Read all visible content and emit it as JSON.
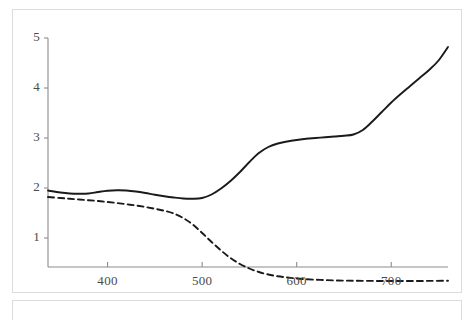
{
  "chart_data": {
    "type": "line",
    "title": "",
    "subtitle": "",
    "xlabel": "",
    "ylabel": "",
    "xlim": [
      337,
      760
    ],
    "ylim": [
      0,
      5.15
    ],
    "grid": false,
    "legend": "none",
    "x_ticks": [
      400,
      500,
      600,
      700
    ],
    "x_tick_labels": [
      "400",
      "500",
      "600",
      "700"
    ],
    "y_ticks": [
      1,
      2,
      3,
      4,
      5
    ],
    "y_tick_labels": [
      "1",
      "2",
      "3",
      "4",
      "5"
    ],
    "series": [
      {
        "name": "solid-curve",
        "style": "solid",
        "color": "#1a1a1a",
        "width": 1.9,
        "x": [
          337,
          350,
          360,
          370,
          380,
          390,
          400,
          410,
          420,
          430,
          440,
          450,
          460,
          470,
          480,
          490,
          500,
          510,
          520,
          530,
          540,
          550,
          560,
          570,
          580,
          590,
          600,
          610,
          620,
          630,
          640,
          650,
          660,
          670,
          680,
          690,
          700,
          710,
          720,
          730,
          740,
          750,
          760
        ],
        "y": [
          1.95,
          1.91,
          1.89,
          1.885,
          1.89,
          1.92,
          1.945,
          1.955,
          1.95,
          1.93,
          1.9,
          1.865,
          1.835,
          1.81,
          1.79,
          1.785,
          1.8,
          1.87,
          1.99,
          2.14,
          2.32,
          2.52,
          2.7,
          2.82,
          2.89,
          2.93,
          2.96,
          2.985,
          3.0,
          3.015,
          3.03,
          3.045,
          3.07,
          3.16,
          3.33,
          3.52,
          3.71,
          3.88,
          4.04,
          4.2,
          4.36,
          4.55,
          4.82
        ]
      },
      {
        "name": "dashed-curve",
        "style": "dashed",
        "color": "#1a1a1a",
        "width": 1.9,
        "dasharray": "6 4",
        "x": [
          337,
          350,
          360,
          370,
          380,
          390,
          400,
          410,
          420,
          430,
          440,
          450,
          460,
          470,
          480,
          490,
          500,
          510,
          520,
          530,
          540,
          550,
          560,
          570,
          580,
          590,
          600,
          610,
          620,
          630,
          640,
          650,
          660,
          680,
          700,
          720,
          740,
          760
        ],
        "y": [
          1.82,
          1.8,
          1.785,
          1.77,
          1.755,
          1.74,
          1.72,
          1.7,
          1.675,
          1.65,
          1.62,
          1.585,
          1.545,
          1.49,
          1.4,
          1.27,
          1.1,
          0.92,
          0.75,
          0.6,
          0.48,
          0.39,
          0.32,
          0.27,
          0.235,
          0.21,
          0.19,
          0.175,
          0.165,
          0.158,
          0.152,
          0.148,
          0.145,
          0.142,
          0.14,
          0.14,
          0.142,
          0.145
        ]
      }
    ],
    "axes": {
      "y_axis_x": 48,
      "x_axis_y": 267,
      "y_top": 38,
      "x_right": 448
    }
  },
  "figure": {
    "panel_label": "",
    "colors": {
      "line": "#1a1a1a",
      "axis": "#808080",
      "border": "#dcdcdc",
      "tick_text": "#4a4a4a",
      "background": "#ffffff"
    }
  }
}
